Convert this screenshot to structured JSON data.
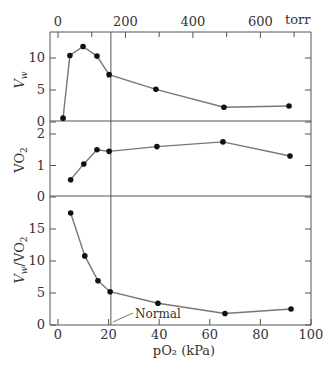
{
  "chart_data": {
    "type": "line",
    "title": "",
    "layout": {
      "panels_stacked": 3,
      "shared_x": true,
      "grid": false,
      "legend": "none",
      "reference_line_x_kpa": 20.9
    },
    "x": [
      2,
      4.7,
      9.9,
      15.4,
      20.9,
      38.7,
      65.6,
      91.3
    ],
    "xlabel": "pO2 (kPa)",
    "xlim": [
      -3,
      100
    ],
    "xticks": [
      0,
      20,
      40,
      60,
      80,
      100
    ],
    "top_axis": {
      "label": "torr",
      "ticks": [
        0,
        200,
        400,
        600
      ],
      "minor_ticks": [
        100,
        300,
        500,
        700
      ]
    },
    "annotation": {
      "text": "Normal",
      "x_kpa": 20.9
    },
    "panels": [
      {
        "id": "vw",
        "ylabel": "Vw",
        "ylim": [
          0,
          13
        ],
        "yticks": [
          0,
          5,
          10
        ],
        "x": [
          2,
          4.7,
          9.9,
          15.4,
          20.2,
          38.7,
          65.6,
          91.3
        ],
        "values": [
          0.6,
          10.4,
          11.8,
          10.3,
          7.4,
          5.1,
          2.3,
          2.5
        ]
      },
      {
        "id": "vo2",
        "ylabel": "VO2",
        "ylim": [
          0,
          2.4
        ],
        "yticks": [
          0,
          1,
          2
        ],
        "x": [
          5,
          10.2,
          15.4,
          20.2,
          39.1,
          65.2,
          91.7
        ],
        "values": [
          0.55,
          1.05,
          1.5,
          1.45,
          1.6,
          1.75,
          1.3
        ]
      },
      {
        "id": "vw_vo2",
        "ylabel": "Vw/VO2",
        "ylim": [
          0,
          20
        ],
        "yticks": [
          0,
          5,
          10,
          15
        ],
        "x": [
          5,
          10.6,
          15.8,
          20.6,
          39.5,
          66,
          92.1
        ],
        "values": [
          17.5,
          10.8,
          6.9,
          5.2,
          3.4,
          1.8,
          2.5
        ]
      }
    ]
  },
  "labels": {
    "top_unit": "torr",
    "x_axis_title": "pO₂ (kPa)",
    "annotation_normal": "Normal",
    "ylabel_vw": "V",
    "ylabel_vw_sub": "w",
    "ylabel_vo2": "VO",
    "ylabel_vo2_sub": "2",
    "ylabel_ratio": "V",
    "ylabel_ratio_sub": "w",
    "ylabel_ratio_rest": "/VO",
    "ylabel_ratio_sub2": "2"
  },
  "colors": {
    "line": "#777777",
    "marker": "#111111",
    "axis": "#555555",
    "text": "#333333"
  }
}
